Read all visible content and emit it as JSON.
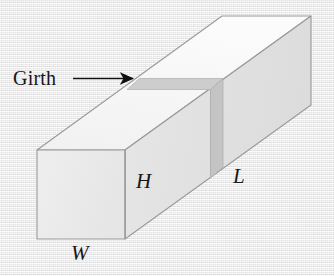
{
  "figure": {
    "background_color": "#f1f1f1",
    "callout": {
      "label": "Girth",
      "arrow": "right-arrow-icon",
      "arrow_color": "#101013"
    },
    "dimension_labels": [
      {
        "key": "H",
        "text": "H",
        "meaning": "height"
      },
      {
        "key": "L",
        "text": "L",
        "meaning": "length"
      },
      {
        "key": "W",
        "text": "W",
        "meaning": "width"
      }
    ],
    "colors": {
      "front_face": "#ececec",
      "top_face": "#f7f7f7",
      "right_face": "#e3e3e3",
      "girth_band_top": "#cfcfcf",
      "girth_band_side": "#c6c6c6",
      "outline": "#8f8f8f",
      "text": "#17171a"
    },
    "geometry": {
      "front_face": [
        [
          37,
          150
        ],
        [
          125,
          150
        ],
        [
          125,
          239
        ],
        [
          37,
          239
        ]
      ],
      "top_face": [
        [
          37,
          150
        ],
        [
          125,
          150
        ],
        [
          311,
          16
        ],
        [
          222,
          16
        ]
      ],
      "right_face": [
        [
          125,
          150
        ],
        [
          311,
          16
        ],
        [
          311,
          105
        ],
        [
          125,
          239
        ]
      ],
      "girth_band_top": [
        [
          138,
          78
        ],
        [
          222,
          78
        ],
        [
          209,
          88
        ],
        [
          126,
          88
        ]
      ],
      "girth_band_side": [
        [
          222,
          78
        ],
        [
          240,
          78
        ],
        [
          240,
          167
        ],
        [
          222,
          167
        ]
      ],
      "arrow": {
        "from": [
          75,
          78
        ],
        "to": [
          140,
          78
        ]
      }
    }
  }
}
